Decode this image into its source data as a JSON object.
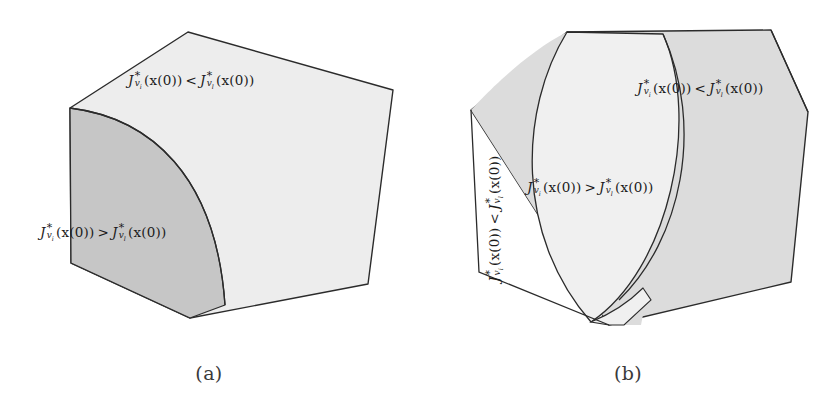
{
  "figure": {
    "background_color": "#ffffff",
    "stroke_color": "#2b2b2b",
    "fill_light": "#eeeeee",
    "fill_mid": "#e3e3e3",
    "fill_dark": "#c6c6c6"
  },
  "panels": [
    {
      "id": "a",
      "caption": "(a)",
      "labels": [
        {
          "name": "top-face-inequality",
          "pieces": {
            "lhs_base": "J",
            "lhs_sup": "*",
            "lhs_sub": "v",
            "lhs_subsub": "i",
            "lhs_arg": "(x(0))",
            "operator": "<",
            "rhs_base": "J",
            "rhs_sup": "*",
            "rhs_sub": "v",
            "rhs_subsub": "l",
            "rhs_arg": "(x(0))"
          },
          "plain": "J*_{v_i}(x(0)) < J*_{v_l}(x(0))"
        },
        {
          "name": "left-face-inequality",
          "pieces": {
            "lhs_base": "J",
            "lhs_sup": "*",
            "lhs_sub": "v",
            "lhs_subsub": "i",
            "lhs_arg": "(x(0))",
            "operator": ">",
            "rhs_base": "J",
            "rhs_sup": "*",
            "rhs_sub": "v",
            "rhs_subsub": "l",
            "rhs_arg": "(x(0))"
          },
          "plain": "J*_{v_i}(x(0)) > J*_{v_l}(x(0))"
        }
      ]
    },
    {
      "id": "b",
      "caption": "(b)",
      "labels": [
        {
          "name": "right-face-inequality",
          "pieces": {
            "lhs_base": "J",
            "lhs_sup": "*",
            "lhs_sub": "v",
            "lhs_subsub": "i",
            "lhs_arg": "(x(0))",
            "operator": "<",
            "rhs_base": "J",
            "rhs_sup": "*",
            "rhs_sub": "v",
            "rhs_subsub": "l",
            "rhs_arg": "(x(0))"
          },
          "plain": "J*_{v_i}(x(0)) < J*_{v_l}(x(0))"
        },
        {
          "name": "center-band-inequality",
          "pieces": {
            "lhs_base": "J",
            "lhs_sup": "*",
            "lhs_sub": "v",
            "lhs_subsub": "i",
            "lhs_arg": "(x(0))",
            "operator": ">",
            "rhs_base": "J",
            "rhs_sup": "*",
            "rhs_sub": "v",
            "rhs_subsub": "l",
            "rhs_arg": "(x(0))"
          },
          "plain": "J*_{v_i}(x(0)) > J*_{v_l}(x(0))"
        },
        {
          "name": "left-face-inequality-rotated",
          "pieces": {
            "lhs_base": "J",
            "lhs_sup": "*",
            "lhs_sub": "v",
            "lhs_subsub": "i",
            "lhs_arg": "(x(0))",
            "operator": "<",
            "rhs_base": "J",
            "rhs_sup": "*",
            "rhs_sub": "v",
            "rhs_subsub": "l",
            "rhs_arg": "(x(0))"
          },
          "plain": "J*_{v_i}(x(0)) < J*_{v_l}(x(0))"
        }
      ]
    }
  ]
}
